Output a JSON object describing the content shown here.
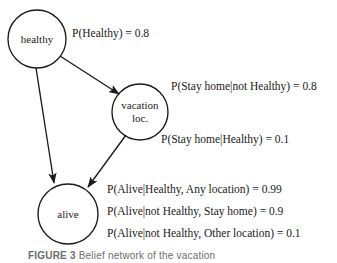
{
  "figure": {
    "type": "bayesian-network-diagram",
    "background_color": "#ffffff",
    "stroke_color": "#1a1a1a"
  },
  "nodes": [
    {
      "id": "healthy",
      "label_line1": "healthy",
      "label_line2": ""
    },
    {
      "id": "vacation",
      "label_line1": "vacation",
      "label_line2": "loc."
    },
    {
      "id": "alive",
      "label_line1": "alive",
      "label_line2": ""
    }
  ],
  "edges": [
    {
      "from": "healthy",
      "to": "vacation"
    },
    {
      "from": "healthy",
      "to": "alive"
    },
    {
      "from": "vacation",
      "to": "alive"
    }
  ],
  "probabilities": [
    {
      "id": "p-healthy",
      "text": "P(Healthy) = 0.8"
    },
    {
      "id": "p-stayhome-not-healthy",
      "text": "P(Stay home|not Healthy) = 0.8"
    },
    {
      "id": "p-stayhome-healthy",
      "text": "P(Stay home|Healthy) = 0.1"
    },
    {
      "id": "p-alive-healthy-any",
      "text": "P(Alive|Healthy, Any location) = 0.99"
    },
    {
      "id": "p-alive-nothealthy-home",
      "text": "P(Alive|not Healthy, Stay home) = 0.9"
    },
    {
      "id": "p-alive-nothealthy-other",
      "text": "P(Alive|not Healthy, Other location) = 0.1"
    }
  ],
  "caption": {
    "title": "FIGURE 3",
    "rest": "  Belief network of the vacation"
  }
}
